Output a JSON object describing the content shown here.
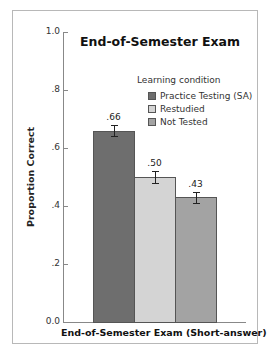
{
  "chart_data": {
    "type": "bar",
    "title": "End-of-Semester Exam",
    "xlabel": "End-of-Semester Exam (Short-answer)",
    "ylabel": "Proportion Correct",
    "ylim": [
      0,
      1.0
    ],
    "yticks": [
      {
        "value": 0.0,
        "label": "0.0"
      },
      {
        "value": 0.2,
        "label": ".2"
      },
      {
        "value": 0.4,
        "label": ".4"
      },
      {
        "value": 0.6,
        "label": ".6"
      },
      {
        "value": 0.8,
        "label": ".8"
      },
      {
        "value": 1.0,
        "label": "1.0"
      }
    ],
    "legend_title": "Learning condition",
    "legend_position": "upper right",
    "grid": false,
    "categories": [
      "End-of-Semester Exam (Short-answer)"
    ],
    "series": [
      {
        "name": "Practice Testing (SA)",
        "values": [
          0.66
        ],
        "label": ".66",
        "error": 0.02,
        "color": "#6e6e6e"
      },
      {
        "name": "Restudied",
        "values": [
          0.5
        ],
        "label": ".50",
        "error": 0.02,
        "color": "#d4d4d4"
      },
      {
        "name": "Not Tested",
        "values": [
          0.43
        ],
        "label": ".43",
        "error": 0.02,
        "color": "#a3a3a3"
      }
    ]
  }
}
